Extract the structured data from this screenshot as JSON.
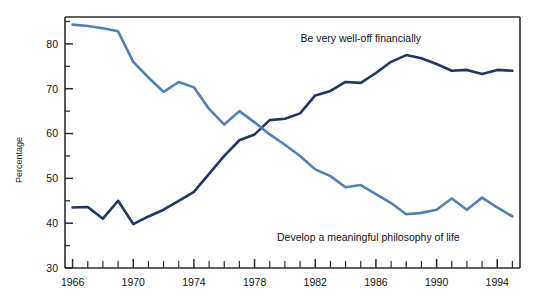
{
  "chart_data": {
    "type": "line",
    "title": "",
    "xlabel": "",
    "ylabel": "Percentage",
    "xlim": [
      1965.5,
      1995.5
    ],
    "ylim": [
      30,
      86
    ],
    "grid": false,
    "legend_position": "inline-annotation",
    "x": [
      1966,
      1967,
      1968,
      1969,
      1970,
      1971,
      1972,
      1973,
      1974,
      1975,
      1976,
      1977,
      1978,
      1979,
      1980,
      1981,
      1982,
      1983,
      1984,
      1985,
      1986,
      1987,
      1988,
      1989,
      1990,
      1991,
      1992,
      1993,
      1994,
      1995
    ],
    "xticks_major": [
      1966,
      1970,
      1974,
      1978,
      1982,
      1986,
      1990,
      1994
    ],
    "xtick_labels": [
      "1966",
      "1970",
      "1974",
      "1978",
      "1982",
      "1986",
      "1990",
      "1994"
    ],
    "yticks_major": [
      30,
      40,
      50,
      60,
      70,
      80
    ],
    "ytick_labels": [
      "30",
      "40",
      "50",
      "60",
      "70",
      "80"
    ],
    "yticks_minor": [
      35,
      45,
      55,
      65,
      75,
      85
    ],
    "series": [
      {
        "name": "Be very well-off financially",
        "color": "#1f3668",
        "annotation": "Be very well-off financially",
        "annotation_x": 1985.0,
        "annotation_y": 80.5,
        "values": [
          43.5,
          43.6,
          41.0,
          45.0,
          39.8,
          41.5,
          43.0,
          45.0,
          47.0,
          51.0,
          55.0,
          58.5,
          59.8,
          63.0,
          63.3,
          64.5,
          68.5,
          69.5,
          71.5,
          71.3,
          73.5,
          76.0,
          77.5,
          76.8,
          75.5,
          74.0,
          74.2,
          73.3,
          74.2,
          74.0
        ]
      },
      {
        "name": "Develop a meaningful philosophy of life",
        "color": "#4e80b8",
        "annotation": "Develop a meaningful philosophy of life",
        "annotation_x": 1985.5,
        "annotation_y": 36.0,
        "values": [
          84.3,
          84.0,
          83.5,
          82.8,
          76.0,
          72.5,
          69.3,
          71.5,
          70.3,
          65.5,
          62.0,
          65.0,
          62.5,
          59.8,
          57.5,
          55.0,
          52.0,
          50.5,
          48.0,
          48.5,
          46.5,
          44.5,
          42.0,
          42.3,
          43.0,
          45.5,
          43.0,
          45.7,
          43.5,
          41.5
        ]
      }
    ]
  },
  "axis": {
    "y_axis_title": "Percentage"
  }
}
